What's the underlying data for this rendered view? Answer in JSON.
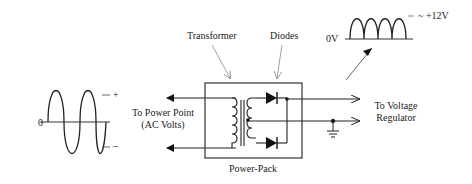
{
  "diagram": {
    "labels": {
      "transformer": "Transformer",
      "diodes": "Diodes",
      "power_pack": "Power-Pack",
      "to_power_point_line1": "To Power Point",
      "to_power_point_line2": "(AC Volts)",
      "to_regulator_line1": "To Voltage",
      "to_regulator_line2": "Regulator",
      "ac_zero": "0",
      "ac_plus": "+",
      "ac_minus": "–",
      "dc_zero": "0V",
      "dc_peak": "~ +12V"
    },
    "components": [
      "ac-sine-wave",
      "transformer",
      "diode-top",
      "diode-bottom",
      "center-tap",
      "ground",
      "rectified-wave"
    ],
    "colors": {
      "line": "#222222",
      "thin_arrow": "#888888",
      "background": "#ffffff"
    }
  }
}
